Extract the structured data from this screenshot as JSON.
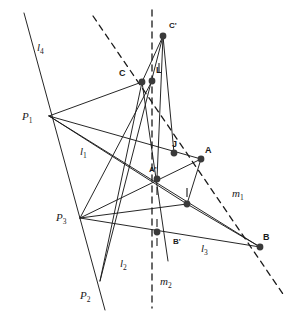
{
  "figure": {
    "width": 302,
    "height": 319,
    "background": "#ffffff",
    "stroke_color": "#1a1a1a",
    "dot_color": "#3a3a3a",
    "labels": {
      "l1": "l",
      "l1_sub": "1",
      "l2": "l",
      "l2_sub": "2",
      "l3": "l",
      "l3_sub": "3",
      "l4": "l",
      "l4_sub": "4",
      "m1": "m",
      "m1_sub": "1",
      "m2": "m",
      "m2_sub": "2",
      "P1": "P",
      "P1_sub": "1",
      "P2": "P",
      "P2_sub": "2",
      "P3": "P",
      "P3_sub": "3",
      "A": "A",
      "A_prime": "A'",
      "B": "B",
      "B_prime": "B'",
      "C": "C",
      "C_prime": "C'",
      "J": "J",
      "L": "L"
    },
    "points": [
      {
        "name": "P1",
        "label": "P",
        "sub": "1",
        "x": 49,
        "y": 116,
        "dot": false,
        "label_x": 22,
        "label_y": 111
      },
      {
        "name": "P2",
        "label": "P",
        "sub": "2",
        "x": 100,
        "y": 281,
        "dot": false,
        "label_x": 80,
        "label_y": 290
      },
      {
        "name": "P3",
        "label": "P",
        "sub": "3",
        "x": 80,
        "y": 218,
        "dot": false,
        "label_x": 56,
        "label_y": 212
      },
      {
        "name": "C",
        "label": "C",
        "sub": "",
        "x": 142,
        "y": 82,
        "dot": true,
        "label_x": 119,
        "label_y": 69
      },
      {
        "name": "L",
        "label": "L",
        "sub": "",
        "x": 152,
        "y": 81,
        "dot": true,
        "label_x": 156,
        "label_y": 66
      },
      {
        "name": "Cprime",
        "label": "C'",
        "sub": "",
        "x": 163,
        "y": 36,
        "dot": true,
        "label_x": 169,
        "label_y": 22
      },
      {
        "name": "J",
        "label": "J",
        "sub": "",
        "x": 174,
        "y": 153,
        "dot": true,
        "label_x": 172,
        "label_y": 140
      },
      {
        "name": "A",
        "label": "A",
        "sub": "",
        "x": 201,
        "y": 159,
        "dot": true,
        "label_x": 205,
        "label_y": 146
      },
      {
        "name": "Aprime",
        "label": "A'",
        "sub": "",
        "x": 157,
        "y": 179,
        "dot": true,
        "label_x": 149,
        "label_y": 166
      },
      {
        "name": "I",
        "label": "",
        "sub": "",
        "x": 187,
        "y": 204,
        "dot": true,
        "label_x": 0,
        "label_y": 0
      },
      {
        "name": "Bprime",
        "label": "B'",
        "sub": "",
        "x": 157,
        "y": 232,
        "dot": true,
        "label_x": 173,
        "label_y": 238
      },
      {
        "name": "B",
        "label": "B",
        "sub": "",
        "x": 260,
        "y": 247,
        "dot": true,
        "label_x": 263,
        "label_y": 233
      }
    ],
    "solid_lines": [
      {
        "name": "line-l4",
        "x1": 24,
        "y1": 13,
        "x2": 105,
        "y2": 310
      },
      {
        "name": "line-P1-C",
        "x1": 49,
        "y1": 116,
        "x2": 142,
        "y2": 82
      },
      {
        "name": "line-P1-J",
        "x1": 49,
        "y1": 116,
        "x2": 201,
        "y2": 159
      },
      {
        "name": "line-P1-I",
        "x1": 49,
        "y1": 116,
        "x2": 187,
        "y2": 204
      },
      {
        "name": "line-P1-Bprime",
        "x1": 49,
        "y1": 116,
        "x2": 260,
        "y2": 247
      },
      {
        "name": "line-P3-C",
        "x1": 80,
        "y1": 218,
        "x2": 152,
        "y2": 81
      },
      {
        "name": "line-P3-Aprime",
        "x1": 80,
        "y1": 218,
        "x2": 201,
        "y2": 159
      },
      {
        "name": "line-P3-I",
        "x1": 80,
        "y1": 218,
        "x2": 187,
        "y2": 204
      },
      {
        "name": "line-P3-B",
        "x1": 80,
        "y1": 218,
        "x2": 260,
        "y2": 247
      },
      {
        "name": "line-P2-C",
        "x1": 100,
        "y1": 281,
        "x2": 142,
        "y2": 82
      },
      {
        "name": "line-P2-Cprime",
        "x1": 100,
        "y1": 281,
        "x2": 163,
        "y2": 36
      },
      {
        "name": "line-Cprime-C",
        "x1": 163,
        "y1": 36,
        "x2": 142,
        "y2": 82
      },
      {
        "name": "line-Cprime-J",
        "x1": 163,
        "y1": 36,
        "x2": 174,
        "y2": 153
      },
      {
        "name": "line-Cprime-Aprime",
        "x1": 163,
        "y1": 36,
        "x2": 157,
        "y2": 179
      },
      {
        "name": "line-A-I",
        "x1": 201,
        "y1": 159,
        "x2": 187,
        "y2": 204
      },
      {
        "name": "line-I-B",
        "x1": 187,
        "y1": 204,
        "x2": 260,
        "y2": 247
      },
      {
        "name": "line-C-Bprime-ext",
        "x1": 142,
        "y1": 82,
        "x2": 168,
        "y2": 261
      }
    ],
    "dashed_lines": [
      {
        "name": "line-m1",
        "x1": 93,
        "y1": 16,
        "x2": 285,
        "y2": 297
      },
      {
        "name": "line-m2",
        "x1": 152,
        "y1": 10,
        "x2": 152,
        "y2": 308
      }
    ],
    "tick_marks": [
      {
        "name": "tick-L",
        "x": 159,
        "y1": 63,
        "y2": 73
      },
      {
        "name": "tick-I",
        "x": 187,
        "y1": 188,
        "y2": 197
      },
      {
        "name": "tick-Bprime-upper",
        "x": 157,
        "y1": 219,
        "y2": 227
      },
      {
        "name": "tick-Bprime-lower",
        "x": 157,
        "y1": 238,
        "y2": 246
      },
      {
        "name": "tick-Aprime-lower",
        "x": 157,
        "y1": 187,
        "y2": 195
      }
    ],
    "line_labels": [
      {
        "name": "label-l4",
        "text": "l",
        "sub": "4",
        "x": 37,
        "y": 42
      },
      {
        "name": "label-l1",
        "text": "l",
        "sub": "1",
        "x": 80,
        "y": 146
      },
      {
        "name": "label-l2",
        "text": "l",
        "sub": "2",
        "x": 120,
        "y": 258
      },
      {
        "name": "label-l3",
        "text": "l",
        "sub": "3",
        "x": 201,
        "y": 243
      },
      {
        "name": "label-m1",
        "text": "m",
        "sub": "1",
        "x": 232,
        "y": 188
      },
      {
        "name": "label-m2",
        "text": "m",
        "sub": "2",
        "x": 160,
        "y": 276
      }
    ]
  }
}
